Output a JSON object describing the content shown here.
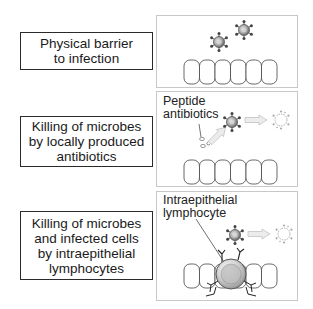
{
  "rows": [
    {
      "label_lines": [
        "Physical barrier",
        "to infection"
      ],
      "panel_caption_lines": []
    },
    {
      "label_lines": [
        "Killing of microbes",
        "by locally produced",
        "antibiotics"
      ],
      "panel_caption_lines": [
        "Peptide",
        "antibiotics"
      ]
    },
    {
      "label_lines": [
        "Killing of microbes",
        "and infected cells",
        "by intraepithelial",
        "lymphocytes"
      ],
      "panel_caption_lines": [
        "Intraepithelial",
        "lymphocyte"
      ]
    }
  ],
  "icons": [
    "microbe-icon",
    "dead-microbe-icon",
    "epithelial-cell-icon",
    "peptide-antibiotic-icon",
    "lymphocyte-icon",
    "arrow-icon"
  ],
  "colors": {
    "border": "#2a2a2a",
    "panel_border": "#c8c8c8",
    "microbe_fill": "#9a9a9a",
    "arrow_fill": "#e6e6e6"
  }
}
